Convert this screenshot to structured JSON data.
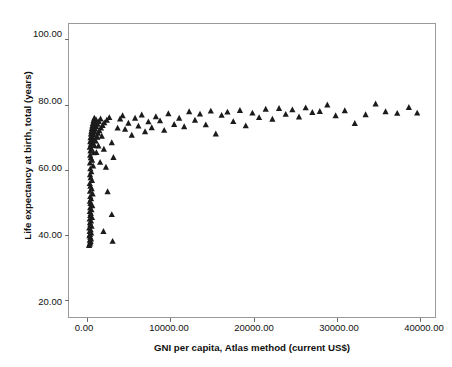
{
  "chart_data": {
    "type": "scatter",
    "title": "",
    "xlabel": "GNI per capita, Atlas method (current US$)",
    "ylabel": "Life expectancy at birth, total (years)",
    "xlim": [
      -2300,
      41800
    ],
    "ylim": [
      14.9,
      105.0
    ],
    "grid": false,
    "legend": null,
    "marker": "triangle",
    "marker_color": "#1b1b1b",
    "xticks": [
      0,
      10000,
      20000,
      30000,
      40000
    ],
    "xticklabels": [
      "0.00",
      "10000.00",
      "20000.00",
      "30000.00",
      "40000.00"
    ],
    "yticks": [
      20,
      40,
      60,
      80,
      100
    ],
    "yticklabels": [
      "20.00",
      "40.00",
      "60.00",
      "80.00",
      "100.00"
    ],
    "series": [
      {
        "name": "Countries",
        "points": [
          [
            180,
            37.0
          ],
          [
            230,
            37.4
          ],
          [
            300,
            37.8
          ],
          [
            350,
            38.2
          ],
          [
            260,
            38.6
          ],
          [
            400,
            39.0
          ],
          [
            320,
            39.5
          ],
          [
            210,
            40.0
          ],
          [
            290,
            40.4
          ],
          [
            430,
            40.8
          ],
          [
            250,
            41.3
          ],
          [
            360,
            41.8
          ],
          [
            200,
            42.4
          ],
          [
            470,
            42.9
          ],
          [
            330,
            43.4
          ],
          [
            280,
            44.0
          ],
          [
            410,
            44.5
          ],
          [
            240,
            45.1
          ],
          [
            520,
            45.6
          ],
          [
            310,
            46.2
          ],
          [
            380,
            46.8
          ],
          [
            260,
            47.4
          ],
          [
            450,
            48.0
          ],
          [
            300,
            48.6
          ],
          [
            560,
            49.2
          ],
          [
            340,
            49.9
          ],
          [
            270,
            50.6
          ],
          [
            420,
            51.3
          ],
          [
            310,
            52.0
          ],
          [
            600,
            52.8
          ],
          [
            280,
            53.6
          ],
          [
            480,
            54.4
          ],
          [
            330,
            55.2
          ],
          [
            250,
            56.0
          ],
          [
            520,
            56.9
          ],
          [
            360,
            57.8
          ],
          [
            290,
            58.7
          ],
          [
            440,
            59.6
          ],
          [
            320,
            60.5
          ],
          [
            660,
            61.4
          ],
          [
            280,
            62.3
          ],
          [
            540,
            63.1
          ],
          [
            380,
            63.9
          ],
          [
            300,
            64.7
          ],
          [
            720,
            65.4
          ],
          [
            340,
            66.0
          ],
          [
            460,
            66.6
          ],
          [
            260,
            67.1
          ],
          [
            820,
            67.6
          ],
          [
            390,
            68.0
          ],
          [
            560,
            68.4
          ],
          [
            310,
            68.8
          ],
          [
            950,
            69.1
          ],
          [
            430,
            69.4
          ],
          [
            640,
            69.7
          ],
          [
            350,
            70.0
          ],
          [
            1100,
            70.3
          ],
          [
            480,
            70.6
          ],
          [
            720,
            70.9
          ],
          [
            400,
            71.2
          ],
          [
            1250,
            71.4
          ],
          [
            530,
            71.6
          ],
          [
            830,
            71.8
          ],
          [
            450,
            72.0
          ],
          [
            1400,
            72.2
          ],
          [
            600,
            72.4
          ],
          [
            910,
            72.6
          ],
          [
            500,
            72.8
          ],
          [
            1600,
            73.0
          ],
          [
            680,
            73.2
          ],
          [
            1050,
            73.4
          ],
          [
            560,
            73.6
          ],
          [
            1800,
            73.8
          ],
          [
            770,
            74.0
          ],
          [
            1200,
            74.2
          ],
          [
            630,
            74.4
          ],
          [
            2000,
            74.6
          ],
          [
            880,
            74.8
          ],
          [
            1350,
            75.0
          ],
          [
            700,
            75.2
          ],
          [
            2300,
            75.4
          ],
          [
            1000,
            75.6
          ],
          [
            1550,
            75.8
          ],
          [
            800,
            76.0
          ],
          [
            2600,
            76.2
          ],
          [
            1150,
            70.2
          ],
          [
            1700,
            70.5
          ],
          [
            900,
            69.0
          ],
          [
            2900,
            68.5
          ],
          [
            1300,
            67.5
          ],
          [
            1950,
            66.5
          ],
          [
            1050,
            65.5
          ],
          [
            3100,
            64.0
          ],
          [
            1500,
            62.5
          ],
          [
            2200,
            61.0
          ],
          [
            2400,
            53.5
          ],
          [
            2900,
            46.5
          ],
          [
            1900,
            41.3
          ],
          [
            3000,
            38.3
          ],
          [
            3600,
            73.0
          ],
          [
            3900,
            75.8
          ],
          [
            4200,
            76.8
          ],
          [
            4500,
            72.6
          ],
          [
            4900,
            74.5
          ],
          [
            5300,
            70.8
          ],
          [
            5700,
            76.0
          ],
          [
            6100,
            73.6
          ],
          [
            6500,
            77.0
          ],
          [
            6900,
            71.9
          ],
          [
            7300,
            74.9
          ],
          [
            7700,
            73.1
          ],
          [
            8200,
            76.5
          ],
          [
            8700,
            75.2
          ],
          [
            9200,
            72.3
          ],
          [
            9700,
            77.4
          ],
          [
            10400,
            74.1
          ],
          [
            11000,
            76.0
          ],
          [
            11600,
            73.4
          ],
          [
            12200,
            78.0
          ],
          [
            12900,
            75.4
          ],
          [
            13500,
            77.3
          ],
          [
            14200,
            74.0
          ],
          [
            14800,
            78.2
          ],
          [
            15400,
            71.2
          ],
          [
            16100,
            76.9
          ],
          [
            16800,
            77.9
          ],
          [
            17500,
            75.0
          ],
          [
            18300,
            78.4
          ],
          [
            19000,
            73.7
          ],
          [
            19800,
            77.6
          ],
          [
            20600,
            76.2
          ],
          [
            21400,
            78.8
          ],
          [
            22200,
            75.7
          ],
          [
            23000,
            79.0
          ],
          [
            23800,
            77.2
          ],
          [
            24600,
            78.6
          ],
          [
            25400,
            76.4
          ],
          [
            26200,
            79.2
          ],
          [
            27000,
            77.8
          ],
          [
            27900,
            78.1
          ],
          [
            28800,
            80.1
          ],
          [
            29800,
            76.8
          ],
          [
            30900,
            78.3
          ],
          [
            32100,
            74.4
          ],
          [
            33400,
            77.1
          ],
          [
            34600,
            80.4
          ],
          [
            35800,
            78.0
          ],
          [
            37200,
            77.5
          ],
          [
            38600,
            79.3
          ],
          [
            39600,
            77.6
          ]
        ]
      }
    ]
  },
  "axis": {
    "y_labels": [
      "100.00",
      "80.00",
      "60.00",
      "40.00",
      "20.00"
    ],
    "x_labels": [
      "0.00",
      "10000.00",
      "20000.00",
      "30000.00",
      "40000.00"
    ]
  }
}
